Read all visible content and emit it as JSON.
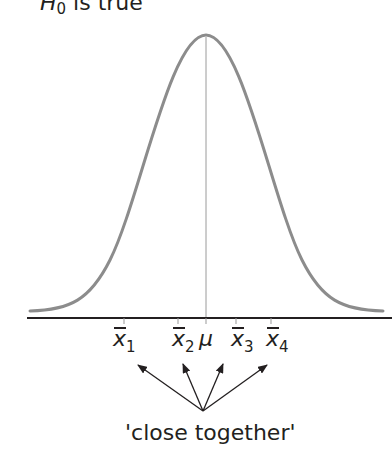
{
  "title": {
    "symbol": "H",
    "subscript": "0",
    "text": " is true"
  },
  "axis_labels": [
    {
      "id": "x1",
      "symbol": "x",
      "subscript": "1",
      "x": 113
    },
    {
      "id": "x2",
      "symbol": "x",
      "subscript": "2",
      "x": 172
    },
    {
      "id": "mu",
      "symbol": "μ",
      "subscript": "",
      "x": 199
    },
    {
      "id": "x3",
      "symbol": "x",
      "subscript": "3",
      "x": 231
    },
    {
      "id": "x4",
      "symbol": "x",
      "subscript": "4",
      "x": 266
    }
  ],
  "caption": "'close together'",
  "colors": {
    "curve": "#8c8c8c",
    "axis": "#231f20",
    "arrows": "#231f20",
    "mean_line": "#9a9a9a"
  }
}
